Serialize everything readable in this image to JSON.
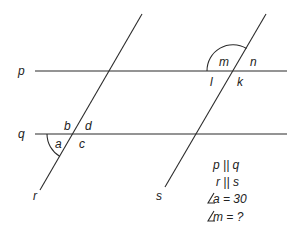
{
  "diagram": {
    "lines": {
      "p": {
        "label": "p"
      },
      "q": {
        "label": "q"
      },
      "r": {
        "label": "r"
      },
      "s": {
        "label": "s"
      }
    },
    "angles_at_r_q": {
      "a": "a",
      "b": "b",
      "c": "c",
      "d": "d"
    },
    "angles_at_s_p": {
      "m": "m",
      "n": "n",
      "l": "l",
      "k": "k"
    },
    "given": [
      "p || q",
      "r || s",
      "∠a = 30",
      "∠m = ?"
    ],
    "given_display": {
      "line1": "p || q",
      "line2": "r || s",
      "line3_angle": "a = 30",
      "line4_angle": "m = ?"
    },
    "colors": {
      "stroke": "#2b2b2b",
      "text": "#222222",
      "background": "#ffffff"
    }
  }
}
